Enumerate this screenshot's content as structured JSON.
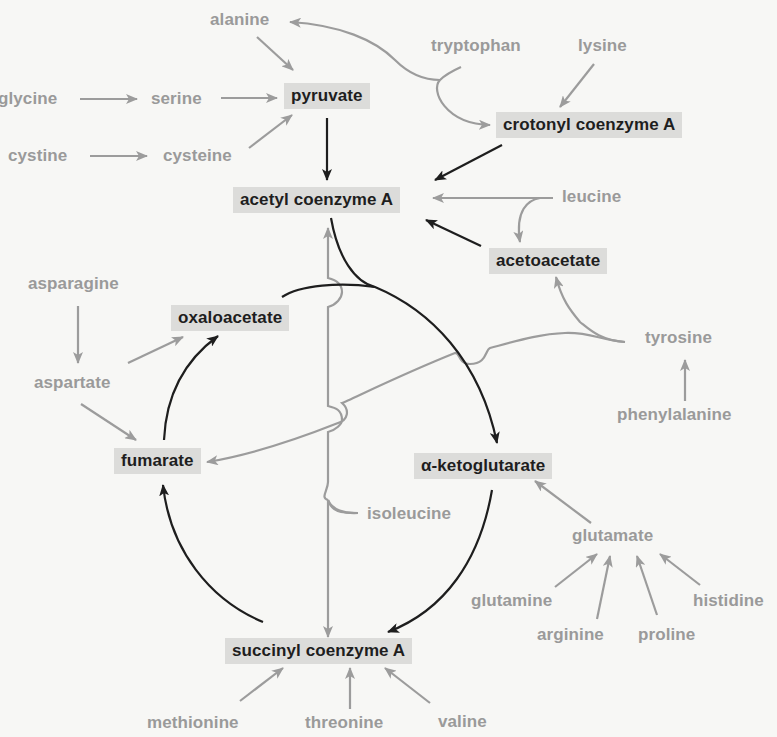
{
  "colors": {
    "background": "#f7f7f5",
    "metabolite_box": "#dcdcda",
    "metabolite_text": "#1e1e1e",
    "amino_acid_text": "#9a9a9a",
    "gray_arrow": "#9c9c9c",
    "black_arrow": "#1e1e1e"
  },
  "metabolites": {
    "pyruvate": "pyruvate",
    "acetyl_coa": "acetyl coenzyme A",
    "crotonyl_coa": "crotonyl coenzyme A",
    "acetoacetate": "acetoacetate",
    "oxaloacetate": "oxaloacetate",
    "fumarate": "fumarate",
    "alpha_ketoglutarate": "α-ketoglutarate",
    "succinyl_coa": "succinyl coenzyme A"
  },
  "amino_acids": {
    "alanine": "alanine",
    "glycine": "glycine",
    "serine": "serine",
    "cystine": "cystine",
    "cysteine": "cysteine",
    "tryptophan": "tryptophan",
    "lysine": "lysine",
    "leucine": "leucine",
    "asparagine": "asparagine",
    "aspartate": "aspartate",
    "tyrosine": "tyrosine",
    "phenylalanine": "phenylalanine",
    "isoleucine": "isoleucine",
    "glutamate": "glutamate",
    "glutamine": "glutamine",
    "arginine": "arginine",
    "proline": "proline",
    "histidine": "histidine",
    "methionine": "methionine",
    "threonine": "threonine",
    "valine": "valine"
  },
  "edges": [
    {
      "from": "glycine",
      "to": "serine",
      "style": "gray"
    },
    {
      "from": "serine",
      "to": "pyruvate",
      "style": "gray"
    },
    {
      "from": "alanine",
      "to": "pyruvate",
      "style": "gray"
    },
    {
      "from": "cystine",
      "to": "cysteine",
      "style": "gray"
    },
    {
      "from": "cysteine",
      "to": "pyruvate",
      "style": "gray"
    },
    {
      "from": "tryptophan",
      "to": "alanine",
      "style": "gray"
    },
    {
      "from": "tryptophan",
      "to": "crotonyl coenzyme A",
      "style": "gray"
    },
    {
      "from": "lysine",
      "to": "crotonyl coenzyme A",
      "style": "gray"
    },
    {
      "from": "pyruvate",
      "to": "acetyl coenzyme A",
      "style": "black"
    },
    {
      "from": "crotonyl coenzyme A",
      "to": "acetyl coenzyme A",
      "style": "black"
    },
    {
      "from": "leucine",
      "to": "acetyl coenzyme A",
      "style": "gray"
    },
    {
      "from": "leucine",
      "to": "acetoacetate",
      "style": "gray"
    },
    {
      "from": "acetoacetate",
      "to": "acetyl coenzyme A",
      "style": "black"
    },
    {
      "from": "tyrosine",
      "to": "acetoacetate",
      "style": "gray"
    },
    {
      "from": "tyrosine",
      "to": "fumarate",
      "style": "gray"
    },
    {
      "from": "phenylalanine",
      "to": "tyrosine",
      "style": "gray"
    },
    {
      "from": "isoleucine",
      "to": "acetyl coenzyme A",
      "style": "gray"
    },
    {
      "from": "isoleucine",
      "to": "succinyl coenzyme A",
      "style": "gray"
    },
    {
      "from": "asparagine",
      "to": "aspartate",
      "style": "gray"
    },
    {
      "from": "aspartate",
      "to": "oxaloacetate",
      "style": "gray"
    },
    {
      "from": "aspartate",
      "to": "fumarate",
      "style": "gray"
    },
    {
      "from": "acetyl coenzyme A",
      "to": "α-ketoglutarate",
      "style": "black"
    },
    {
      "from": "oxaloacetate",
      "to": "α-ketoglutarate",
      "style": "black"
    },
    {
      "from": "α-ketoglutarate",
      "to": "succinyl coenzyme A",
      "style": "black"
    },
    {
      "from": "succinyl coenzyme A",
      "to": "fumarate",
      "style": "black"
    },
    {
      "from": "fumarate",
      "to": "oxaloacetate",
      "style": "black"
    },
    {
      "from": "glutamate",
      "to": "α-ketoglutarate",
      "style": "gray"
    },
    {
      "from": "glutamine",
      "to": "glutamate",
      "style": "gray"
    },
    {
      "from": "arginine",
      "to": "glutamate",
      "style": "gray"
    },
    {
      "from": "proline",
      "to": "glutamate",
      "style": "gray"
    },
    {
      "from": "histidine",
      "to": "glutamate",
      "style": "gray"
    },
    {
      "from": "methionine",
      "to": "succinyl coenzyme A",
      "style": "gray"
    },
    {
      "from": "threonine",
      "to": "succinyl coenzyme A",
      "style": "gray"
    },
    {
      "from": "valine",
      "to": "succinyl coenzyme A",
      "style": "gray"
    }
  ]
}
